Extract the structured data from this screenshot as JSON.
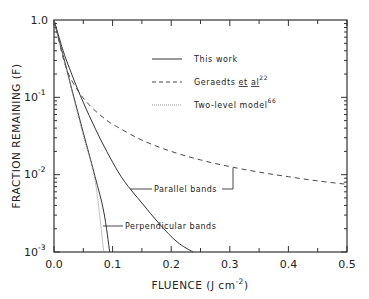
{
  "chart_data": {
    "type": "line",
    "title": "",
    "xlabel": "FLUENCE  (J cm⁻²)",
    "ylabel": "FRACTION REMAINING (F)",
    "xlim": [
      0.0,
      0.5
    ],
    "ylim": [
      0.001,
      1.0
    ],
    "yscale": "log",
    "grid": false,
    "legend_position": "upper right (inside)",
    "x_ticks": [
      "0.0",
      "0.1",
      "0.2",
      "0.3",
      "0.4",
      "0.5"
    ],
    "y_ticks": [
      "1.0",
      "10⁻¹",
      "10⁻²",
      "10⁻³"
    ],
    "legend": [
      {
        "label": "This work",
        "style": "solid"
      },
      {
        "label": "Geraedts et al",
        "superscript": "22",
        "style": "dashed"
      },
      {
        "label": "Two-level model",
        "superscript": "66",
        "style": "dotted"
      }
    ],
    "annotations": [
      "Parallel bands",
      "Perpendicular bands"
    ],
    "series": [
      {
        "name": "This work - Parallel bands",
        "style": "solid",
        "x": [
          0.0,
          0.01,
          0.02,
          0.04,
          0.06,
          0.08,
          0.1,
          0.12,
          0.15,
          0.18,
          0.21,
          0.237
        ],
        "y": [
          1.0,
          0.55,
          0.32,
          0.13,
          0.058,
          0.028,
          0.0145,
          0.0082,
          0.0043,
          0.0023,
          0.00135,
          0.001
        ]
      },
      {
        "name": "This work - Perpendicular bands",
        "style": "solid",
        "x": [
          0.0,
          0.01,
          0.02,
          0.03,
          0.05,
          0.07,
          0.085,
          0.095
        ],
        "y": [
          1.0,
          0.5,
          0.26,
          0.13,
          0.035,
          0.0095,
          0.0033,
          0.001
        ]
      },
      {
        "name": "Geraedts et al",
        "style": "dashed",
        "x": [
          0.0,
          0.02,
          0.04,
          0.06,
          0.08,
          0.1,
          0.15,
          0.2,
          0.25,
          0.3,
          0.35,
          0.4,
          0.45,
          0.5
        ],
        "y": [
          1.0,
          0.25,
          0.125,
          0.08,
          0.058,
          0.045,
          0.028,
          0.02,
          0.0155,
          0.0127,
          0.0108,
          0.0094,
          0.0083,
          0.0075
        ]
      },
      {
        "name": "Two-level model",
        "style": "dotted",
        "x": [
          0.0,
          0.01,
          0.02,
          0.03,
          0.05,
          0.07,
          0.085
        ],
        "y": [
          1.0,
          0.49,
          0.25,
          0.125,
          0.032,
          0.0085,
          0.001
        ]
      }
    ]
  },
  "labels": {
    "y_axis_title": "FRACTION REMAINING (F)",
    "x_axis_title_prefix": "FLUENCE  (J cm",
    "x_axis_title_sup": "-2",
    "x_axis_title_suffix": ")",
    "xticks": [
      "0.0",
      "0.1",
      "0.2",
      "0.3",
      "0.4",
      "0.5"
    ],
    "ytick_top": "1.0",
    "ytick_base": "10",
    "ytick_exps": [
      "-1",
      "-2",
      "-3"
    ],
    "legend_this_work": "This work",
    "legend_geraedts": "Geraedts",
    "legend_et": "et",
    "legend_al": "al",
    "legend_ref22": "22",
    "legend_two_level": "Two-level model",
    "legend_ref66": "66",
    "anno_parallel": "Parallel bands",
    "anno_perpendicular": "Perpendicular bands"
  }
}
